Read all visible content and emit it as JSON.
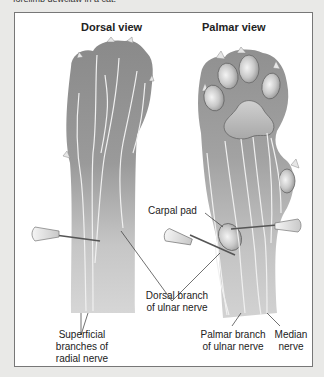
{
  "caption": "forelimb dewclaw in a cat.",
  "diagram": {
    "views": [
      {
        "title": "Dorsal view"
      },
      {
        "title": "Palmar view"
      }
    ],
    "labels": {
      "carpal_pad": "Carpal pad",
      "dorsal_branch_line1": "Dorsal branch",
      "dorsal_branch_line2": "of ulnar nerve",
      "superficial_line1": "Superficial",
      "superficial_line2": "branches of",
      "superficial_line3": "radial nerve",
      "palmar_branch_line1": "Palmar branch",
      "palmar_branch_line2": "of ulnar nerve",
      "median_line1": "Median",
      "median_line2": "nerve"
    },
    "colors": {
      "paw_dark": "#8e8e8e",
      "paw_light": "#d4d4d4",
      "pad": "#c8c8c8",
      "nerve": "#f2f2f2",
      "frame_border": "#777777"
    }
  }
}
